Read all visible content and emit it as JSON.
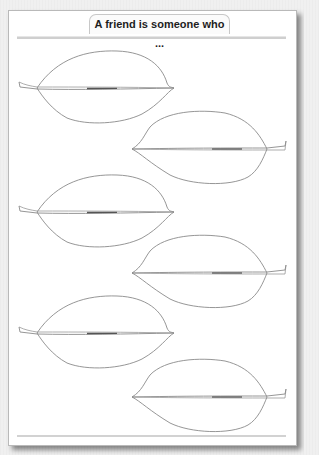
{
  "worksheet": {
    "title": "A friend is someone who ...",
    "leaves": [
      {
        "id": 1,
        "stem_side": "left",
        "text": ""
      },
      {
        "id": 2,
        "stem_side": "right",
        "text": ""
      },
      {
        "id": 3,
        "stem_side": "left",
        "text": ""
      },
      {
        "id": 4,
        "stem_side": "right",
        "text": ""
      },
      {
        "id": 5,
        "stem_side": "left",
        "text": ""
      },
      {
        "id": 6,
        "stem_side": "right",
        "text": ""
      }
    ],
    "colors": {
      "background": "#f0f0f0",
      "page": "#ffffff",
      "leaf_outline": "#8a8a8a",
      "rule": "#cfcfcf",
      "title_text": "#1e1e1e"
    }
  }
}
